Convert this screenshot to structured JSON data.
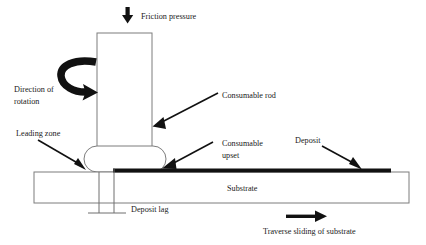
{
  "figure": {
    "kind": "friction-surfacing-process-schematic",
    "background_color": "#ffffff",
    "line_color": "#7d7d7d",
    "ink_color": "#111111"
  },
  "labels": {
    "friction_pressure": "Friction pressure",
    "direction_of_rotation_line1": "Direction of",
    "direction_of_rotation_line2": "rotation",
    "consumable_rod": "Consumable rod",
    "leading_zone": "Leading zone",
    "consumable_upset_line1": "Consumable",
    "consumable_upset_line2": "upset",
    "deposit": "Deposit",
    "substrate": "Substrate",
    "deposit_lag": "Deposit lag",
    "traverse_sliding": "Traverse sliding of substrate"
  },
  "icons": {
    "down_arrow": "downward-arrow-icon",
    "rotation_arrow": "curved-rotation-arrow-icon",
    "pointer_rod": "pointer-arrow-icon",
    "pointer_leading_zone": "pointer-arrow-icon",
    "pointer_upset": "pointer-arrow-icon",
    "pointer_deposit": "pointer-arrow-icon",
    "traverse_arrow": "rightward-arrow-icon"
  },
  "geometry": {
    "rod": {
      "x": 97,
      "y": 33,
      "width": 55,
      "height": 119
    },
    "upset": {
      "x": 84,
      "y": 146,
      "width": 82,
      "height": 26,
      "radius": 13
    },
    "substrate": {
      "x": 34,
      "y": 172,
      "width": 375,
      "height": 31
    },
    "deposit": {
      "x": 113,
      "y": 169,
      "width": 278,
      "height": 4
    },
    "deposit_lag_channel": {
      "x": 99,
      "y": 172,
      "width": 15,
      "height": 41
    },
    "deposit_lag_base": {
      "x1": 88,
      "x2": 126,
      "y": 213
    }
  }
}
